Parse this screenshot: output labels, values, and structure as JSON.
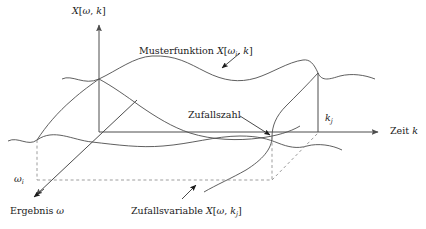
{
  "figure": {
    "kind": "stochastic-process-3d-diagram",
    "language": "de",
    "background_color": "#ffffff",
    "line_color": "#4d4d4d",
    "axis_color": "#4d4d4d",
    "text_color": "#1a1a1a",
    "dash_color": "#8c8c8c"
  },
  "axes": {
    "vertical": {
      "label_plain": "X[ω, k]",
      "label_head": "X",
      "label_open": "[",
      "label_arg1": "ω",
      "label_comma": ", ",
      "label_arg2": "k",
      "label_close": "]"
    },
    "horizontal": {
      "label_plain": "Zeit k",
      "label_word": "Zeit",
      "label_var": "k"
    },
    "depth": {
      "label_plain": "Ergebnis ω",
      "label_word": "Ergebnis",
      "label_var": "ω"
    }
  },
  "annotations": {
    "musterfunktion": {
      "word": "Musterfunktion",
      "head": "X",
      "open": "[",
      "arg1": "ω",
      "sub1": "i",
      "comma": ", ",
      "arg2": "k",
      "close": "]",
      "plain": "Musterfunktion X[ωi, k]"
    },
    "zufallszahl": {
      "plain": "Zufallszahl"
    },
    "zufallsvariable": {
      "word": "Zufallsvariable",
      "head": "X",
      "open": "[",
      "arg1": "ω",
      "comma": ", ",
      "arg2": "k",
      "sub2": "j",
      "close": "]",
      "plain": "Zufallsvariable X[ω, kj]"
    }
  },
  "ticks": {
    "k_j": {
      "var": "k",
      "sub": "j",
      "plain": "kj"
    },
    "omega_i": {
      "var": "ω",
      "sub": "i",
      "plain": "ωi"
    }
  }
}
